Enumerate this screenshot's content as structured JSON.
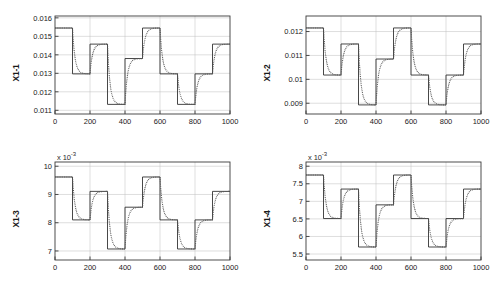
{
  "figure": {
    "title": "",
    "background": "#ffffff",
    "layout": "2x2 subplot grid",
    "line_colors": {
      "reference": "#333333",
      "response": "#555555"
    }
  },
  "chart_data": [
    {
      "type": "line",
      "title": "",
      "xlabel": "",
      "ylabel": "X1-1",
      "xlim": [
        0,
        1000
      ],
      "ylim": [
        0.0108,
        0.0161
      ],
      "xticks": [
        0,
        200,
        400,
        600,
        800,
        1000
      ],
      "xticklabels": [
        "0",
        "200",
        "400",
        "600",
        "800",
        "1000"
      ],
      "yticks": [
        0.011,
        0.012,
        0.013,
        0.014,
        0.015,
        0.016
      ],
      "yticklabels": [
        "0.011",
        "0.012",
        "0.013",
        "0.014",
        "0.015",
        "0.016"
      ],
      "y_exponent": "",
      "grid": true,
      "legend": null,
      "step_times": [
        0,
        100,
        200,
        300,
        400,
        500,
        600,
        700,
        800,
        900,
        1000
      ],
      "series": [
        {
          "name": "reference",
          "style": "solid",
          "levels": [
            0.01545,
            0.01297,
            0.01458,
            0.01132,
            0.0138,
            0.01545,
            0.01297,
            0.01132,
            0.01297,
            0.01458
          ]
        },
        {
          "name": "response",
          "style": "dotted",
          "levels": [
            0.01545,
            0.01297,
            0.01458,
            0.01132,
            0.0138,
            0.01545,
            0.01297,
            0.01132,
            0.01297,
            0.01458
          ]
        }
      ]
    },
    {
      "type": "line",
      "title": "",
      "xlabel": "",
      "ylabel": "X1-2",
      "xlim": [
        0,
        1000
      ],
      "ylim": [
        0.00855,
        0.01265
      ],
      "xticks": [
        0,
        200,
        400,
        600,
        800,
        1000
      ],
      "xticklabels": [
        "0",
        "200",
        "400",
        "600",
        "800",
        "1000"
      ],
      "yticks": [
        0.009,
        0.01,
        0.011,
        0.012
      ],
      "yticklabels": [
        "0.009",
        "0.01",
        "0.011",
        "0.012"
      ],
      "y_exponent": "",
      "grid": true,
      "legend": null,
      "step_times": [
        0,
        100,
        200,
        300,
        400,
        500,
        600,
        700,
        800,
        900,
        1000
      ],
      "series": [
        {
          "name": "reference",
          "style": "solid",
          "levels": [
            0.01215,
            0.01018,
            0.01148,
            0.00893,
            0.01085,
            0.01215,
            0.01018,
            0.00893,
            0.01018,
            0.01148
          ]
        },
        {
          "name": "response",
          "style": "dotted",
          "levels": [
            0.01215,
            0.01018,
            0.01148,
            0.00893,
            0.01085,
            0.01215,
            0.01018,
            0.00893,
            0.01018,
            0.01148
          ]
        }
      ]
    },
    {
      "type": "line",
      "title": "",
      "xlabel": "",
      "ylabel": "X1-3",
      "xlim": [
        0,
        1000
      ],
      "ylim": [
        0.00668,
        0.01015
      ],
      "xticks": [
        0,
        200,
        400,
        600,
        800,
        1000
      ],
      "xticklabels": [
        "0",
        "200",
        "400",
        "600",
        "800",
        "1000"
      ],
      "yticks": [
        0.007,
        0.008,
        0.009,
        0.01
      ],
      "yticklabels": [
        "7",
        "8",
        "9",
        "10"
      ],
      "y_exponent": "x 10-3",
      "grid": true,
      "legend": null,
      "step_times": [
        0,
        100,
        200,
        300,
        400,
        500,
        600,
        700,
        800,
        900,
        1000
      ],
      "series": [
        {
          "name": "reference",
          "style": "solid",
          "levels": [
            0.00962,
            0.0081,
            0.00911,
            0.00707,
            0.00855,
            0.00962,
            0.0081,
            0.00707,
            0.0081,
            0.00911
          ]
        },
        {
          "name": "response",
          "style": "dotted",
          "levels": [
            0.00962,
            0.0081,
            0.00911,
            0.00707,
            0.00855,
            0.00962,
            0.0081,
            0.00707,
            0.0081,
            0.00911
          ]
        }
      ]
    },
    {
      "type": "line",
      "title": "",
      "xlabel": "",
      "ylabel": "X1-4",
      "xlim": [
        0,
        1000
      ],
      "ylim": [
        0.00533,
        0.00812
      ],
      "xticks": [
        0,
        200,
        400,
        600,
        800,
        1000
      ],
      "xticklabels": [
        "0",
        "200",
        "400",
        "600",
        "800",
        "1000"
      ],
      "yticks": [
        0.0055,
        0.006,
        0.0065,
        0.007,
        0.0075,
        0.008
      ],
      "yticklabels": [
        "5.5",
        "6",
        "6.5",
        "7",
        "7.5",
        "8"
      ],
      "y_exponent": "x 10-3",
      "grid": true,
      "legend": null,
      "step_times": [
        0,
        100,
        200,
        300,
        400,
        500,
        600,
        700,
        800,
        900,
        1000
      ],
      "series": [
        {
          "name": "reference",
          "style": "solid",
          "levels": [
            0.00775,
            0.00651,
            0.00735,
            0.0057,
            0.0069,
            0.00775,
            0.00651,
            0.0057,
            0.00651,
            0.00735
          ]
        },
        {
          "name": "response",
          "style": "dotted",
          "levels": [
            0.00775,
            0.00651,
            0.00735,
            0.0057,
            0.0069,
            0.00775,
            0.00651,
            0.0057,
            0.00651,
            0.00735
          ]
        }
      ]
    }
  ]
}
